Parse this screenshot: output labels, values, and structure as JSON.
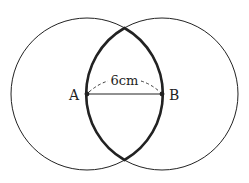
{
  "diagram": {
    "points": [
      {
        "id": "A",
        "label": "A"
      },
      {
        "id": "B",
        "label": "B"
      }
    ],
    "distance_label": "6cm"
  },
  "colors": {
    "stroke": "#222222",
    "background": "#ffffff"
  }
}
